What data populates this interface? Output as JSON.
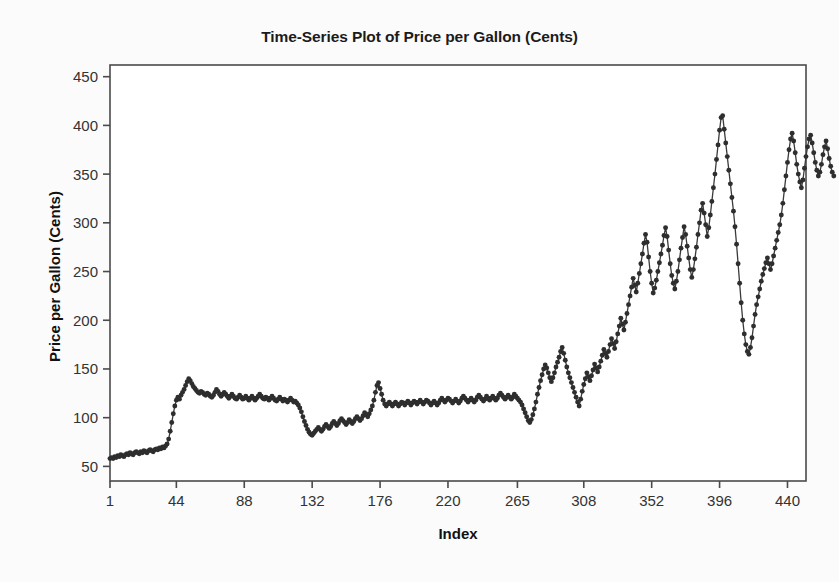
{
  "chart_data": {
    "type": "line",
    "title": "Time-Series Plot of Price per Gallon (Cents)",
    "xlabel": "Index",
    "ylabel": "Price per Gallon (Cents)",
    "xlim": [
      1,
      452
    ],
    "ylim": [
      35,
      462
    ],
    "grid": false,
    "legend": null,
    "marker": "filled-circle",
    "line_color": "#3a3a3a",
    "marker_color": "#2e2e2e",
    "background_color": "#fbfbfb",
    "plot_area_color": "#ffffff",
    "xticks": [
      1,
      44,
      88,
      132,
      176,
      220,
      265,
      308,
      352,
      396,
      440
    ],
    "yticks": [
      50,
      100,
      150,
      200,
      250,
      300,
      350,
      400,
      450
    ],
    "series": [
      {
        "name": "Price per Gallon (Cents)",
        "values": [
          58,
          59,
          58,
          60,
          59,
          61,
          60,
          62,
          61,
          60,
          62,
          63,
          62,
          64,
          63,
          62,
          64,
          65,
          64,
          63,
          65,
          64,
          66,
          65,
          64,
          66,
          67,
          66,
          65,
          67,
          68,
          67,
          69,
          68,
          70,
          69,
          71,
          73,
          78,
          86,
          95,
          104,
          112,
          118,
          121,
          119,
          123,
          126,
          129,
          133,
          137,
          140,
          138,
          135,
          132,
          130,
          128,
          126,
          125,
          127,
          126,
          124,
          123,
          125,
          124,
          122,
          121,
          123,
          126,
          129,
          127,
          124,
          122,
          124,
          126,
          124,
          122,
          120,
          122,
          124,
          122,
          120,
          119,
          121,
          123,
          121,
          119,
          120,
          122,
          120,
          118,
          120,
          122,
          120,
          118,
          120,
          122,
          124,
          122,
          120,
          119,
          121,
          120,
          118,
          120,
          122,
          120,
          118,
          117,
          119,
          121,
          119,
          117,
          119,
          118,
          116,
          118,
          120,
          118,
          116,
          117,
          115,
          113,
          110,
          106,
          101,
          96,
          92,
          88,
          85,
          83,
          82,
          84,
          86,
          88,
          90,
          88,
          86,
          88,
          91,
          93,
          91,
          89,
          91,
          94,
          96,
          94,
          92,
          94,
          97,
          99,
          97,
          95,
          93,
          95,
          98,
          96,
          94,
          96,
          99,
          101,
          99,
          97,
          99,
          102,
          105,
          103,
          101,
          104,
          108,
          112,
          118,
          126,
          133,
          136,
          130,
          124,
          118,
          114,
          112,
          114,
          116,
          114,
          112,
          114,
          116,
          114,
          112,
          114,
          116,
          115,
          113,
          115,
          117,
          115,
          113,
          115,
          117,
          116,
          114,
          116,
          118,
          116,
          114,
          116,
          118,
          117,
          115,
          113,
          115,
          117,
          115,
          113,
          115,
          118,
          120,
          118,
          116,
          118,
          120,
          119,
          117,
          115,
          117,
          119,
          117,
          115,
          117,
          120,
          122,
          120,
          118,
          116,
          118,
          120,
          118,
          116,
          118,
          121,
          123,
          121,
          119,
          117,
          119,
          122,
          120,
          118,
          120,
          122,
          120,
          118,
          120,
          123,
          125,
          123,
          121,
          119,
          121,
          123,
          121,
          119,
          121,
          124,
          122,
          120,
          118,
          116,
          113,
          109,
          105,
          101,
          97,
          95,
          98,
          103,
          109,
          116,
          124,
          131,
          138,
          144,
          150,
          154,
          151,
          146,
          141,
          137,
          141,
          146,
          152,
          157,
          162,
          168,
          172,
          166,
          159,
          152,
          146,
          141,
          136,
          131,
          126,
          121,
          116,
          112,
          119,
          127,
          134,
          140,
          146,
          142,
          138,
          143,
          149,
          155,
          151,
          147,
          152,
          158,
          164,
          170,
          166,
          162,
          168,
          175,
          181,
          176,
          171,
          178,
          186,
          194,
          202,
          196,
          190,
          198,
          207,
          216,
          225,
          234,
          243,
          236,
          229,
          238,
          248,
          258,
          268,
          279,
          288,
          280,
          265,
          250,
          238,
          228,
          233,
          241,
          250,
          259,
          268,
          277,
          287,
          295,
          286,
          272,
          258,
          246,
          238,
          232,
          240,
          250,
          262,
          274,
          285,
          296,
          288,
          276,
          264,
          252,
          244,
          252,
          263,
          275,
          288,
          300,
          313,
          320,
          310,
          298,
          286,
          295,
          308,
          322,
          336,
          350,
          365,
          380,
          395,
          408,
          410,
          396,
          382,
          368,
          354,
          340,
          326,
          312,
          296,
          278,
          258,
          238,
          218,
          200,
          186,
          175,
          168,
          165,
          172,
          182,
          194,
          206,
          216,
          224,
          232,
          240,
          247,
          253,
          259,
          264,
          258,
          252,
          258,
          266,
          274,
          282,
          290,
          298,
          308,
          320,
          334,
          348,
          362,
          375,
          386,
          392,
          384,
          372,
          360,
          350,
          342,
          336,
          344,
          356,
          368,
          378,
          386,
          390,
          382,
          372,
          362,
          354,
          348,
          352,
          360,
          370,
          378,
          384,
          376,
          366,
          358,
          352,
          348
        ]
      }
    ]
  }
}
